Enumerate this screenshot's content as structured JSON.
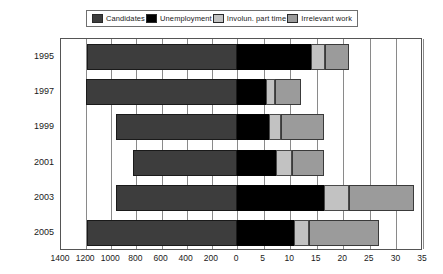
{
  "legend": {
    "items": [
      {
        "label": "Candidates",
        "swatch": "#3d3d3d",
        "icon": "legend-swatch-icon"
      },
      {
        "label": "Unemployment",
        "swatch": "#000000",
        "icon": "legend-swatch-icon"
      },
      {
        "label": "Involun. part time",
        "swatch": "#c2c2c2",
        "icon": "legend-swatch-icon"
      },
      {
        "label": "Irrelevant work",
        "swatch": "#9b9b9b",
        "icon": "legend-swatch-icon"
      }
    ]
  },
  "colors": {
    "candidates": "#3d3d3d",
    "unemployment": "#000000",
    "involun_part_time": "#c2c2c2",
    "irrelevant_work": "#9b9b9b",
    "grid": "#8a8a8a",
    "frame": "#555555"
  },
  "chart_data": {
    "type": "bar",
    "orientation": "horizontal",
    "title": "",
    "subtitle": "",
    "xlabel": "",
    "ylabel": "",
    "grid": true,
    "legend_position": "top",
    "categories": [
      "1995",
      "1997",
      "1999",
      "2001",
      "2003",
      "2005"
    ],
    "left_axis": {
      "name": "Candidates",
      "ticks": [
        1400,
        1200,
        1000,
        800,
        600,
        400,
        200,
        0
      ],
      "range": [
        1400,
        0
      ],
      "direction": "reversed"
    },
    "right_axis": {
      "name": "Percent",
      "ticks": [
        0,
        5,
        10,
        15,
        20,
        25,
        30,
        35
      ],
      "range": [
        0,
        35
      ]
    },
    "xtick_labels": [
      "1400",
      "1200",
      "1000",
      "800",
      "600",
      "400",
      "200",
      "0",
      "5",
      "10",
      "15",
      "20",
      "25",
      "30",
      "35"
    ],
    "series": [
      {
        "name": "Candidates",
        "axis": "left",
        "values": [
          1190,
          1200,
          960,
          830,
          960,
          1190
        ]
      },
      {
        "name": "Unemployment",
        "axis": "right",
        "values": [
          14.0,
          5.5,
          6.0,
          7.3,
          16.3,
          10.8
        ]
      },
      {
        "name": "Involun. part time",
        "axis": "right",
        "values": [
          2.6,
          1.7,
          2.3,
          3.0,
          4.7,
          2.7
        ]
      },
      {
        "name": "Irrelevant work",
        "axis": "right",
        "values": [
          4.4,
          4.8,
          8.0,
          6.0,
          12.3,
          13.3
        ]
      }
    ],
    "stacked_right_totals": [
      21.0,
      12.0,
      16.3,
      16.3,
      33.3,
      26.8
    ]
  }
}
